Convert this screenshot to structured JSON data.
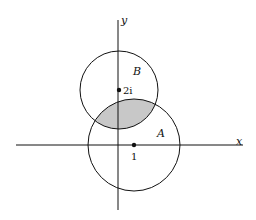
{
  "diagram": {
    "axes": {
      "x_label": "x",
      "y_label": "y"
    },
    "circles": [
      {
        "name": "A",
        "label": "A",
        "center_label": "1"
      },
      {
        "name": "B",
        "label": "B",
        "center_label": "2i"
      }
    ],
    "shaded_region": "intersection of A and B",
    "colors": {
      "stroke": "#111111",
      "shade": "#c8c8c8",
      "background": "#ffffff"
    }
  }
}
